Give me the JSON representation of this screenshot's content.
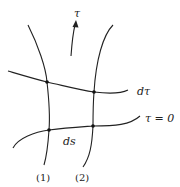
{
  "diagram": {
    "type": "coordinate-grid-sketch",
    "labels": {
      "time_axis": "τ",
      "upper_surface": "dτ",
      "lower_surface": "τ = 0",
      "separation": "ds",
      "curve1": "(1)",
      "curve2": "(2)"
    },
    "colors": {
      "stroke": "#222222",
      "background": "#ffffff"
    },
    "points": [
      {
        "name": "curve1-dtau",
        "x": 47,
        "y": 82
      },
      {
        "name": "curve2-dtau",
        "x": 94,
        "y": 92
      },
      {
        "name": "curve1-tau0",
        "x": 49,
        "y": 130
      },
      {
        "name": "curve2-tau0",
        "x": 93,
        "y": 126
      }
    ]
  }
}
